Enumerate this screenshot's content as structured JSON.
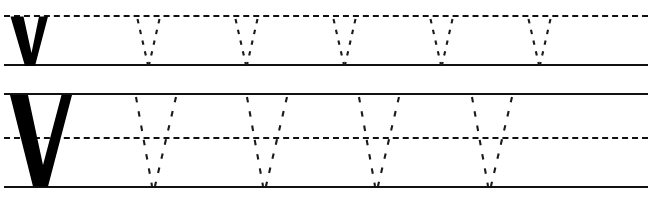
{
  "worksheet": {
    "title": "Letter V handwriting practice worksheet",
    "letter_uppercase": "V",
    "letter_lowercase": "v",
    "ink_color": "#000000",
    "line_color": "#111111",
    "background_color": "#ffffff",
    "width": 660,
    "height": 203,
    "rows": [
      {
        "id": "row-lowercase",
        "letter": "v",
        "letter_case": "lowercase",
        "model_count": 1,
        "trace_count": 5,
        "lines": [
          {
            "name": "x-height-line",
            "style": "dashed",
            "y": 15
          },
          {
            "name": "baseline",
            "style": "solid",
            "y": 64
          }
        ],
        "model_letter": {
          "x": 10,
          "y": 16,
          "width": 38,
          "height": 50
        },
        "trace_letters": [
          {
            "index": 1,
            "apex_x": 148
          },
          {
            "index": 2,
            "apex_x": 246
          },
          {
            "index": 3,
            "apex_x": 344
          },
          {
            "index": 4,
            "apex_x": 441
          },
          {
            "index": 5,
            "apex_x": 539
          }
        ]
      },
      {
        "id": "row-uppercase",
        "letter": "V",
        "letter_case": "uppercase",
        "model_count": 1,
        "trace_count": 4,
        "lines": [
          {
            "name": "cap-height-line",
            "style": "solid",
            "y": 93
          },
          {
            "name": "midline",
            "style": "dashed",
            "y": 137
          },
          {
            "name": "baseline",
            "style": "solid",
            "y": 186
          }
        ],
        "model_letter": {
          "x": 10,
          "y": 95,
          "width": 62,
          "height": 91
        },
        "trace_letters": [
          {
            "index": 1,
            "apex_x": 152
          },
          {
            "index": 2,
            "apex_x": 263
          },
          {
            "index": 3,
            "apex_x": 375
          },
          {
            "index": 4,
            "apex_x": 488
          }
        ]
      }
    ],
    "line_extent": {
      "left": 4,
      "right": 648
    }
  }
}
